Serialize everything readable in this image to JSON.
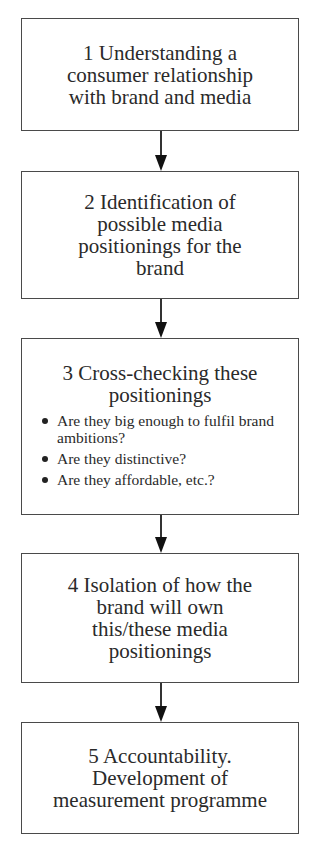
{
  "diagram": {
    "type": "flowchart",
    "steps": [
      {
        "number": "1",
        "title": "1  Understanding a consumer relationship with brand and media",
        "lines": [
          "1  Understanding a",
          "consumer relationship",
          "with brand and media"
        ]
      },
      {
        "number": "2",
        "title": "2  Identification of possible media positionings for the brand",
        "lines": [
          "2  Identification of",
          "possible media",
          "positionings for the",
          "brand"
        ]
      },
      {
        "number": "3",
        "title": "3  Cross-checking these positionings",
        "lines": [
          "3  Cross-checking these",
          "positionings"
        ],
        "bullets": [
          "Are they big enough to fulfil brand ambitions?",
          "Are they distinctive?",
          "Are they affordable, etc.?"
        ]
      },
      {
        "number": "4",
        "title": "4  Isolation of how the brand will own this/these media positionings",
        "lines": [
          "4  Isolation of how the",
          "brand will own",
          "this/these media",
          "positionings"
        ]
      },
      {
        "number": "5",
        "title": "5  Accountability. Development of measurement programme",
        "lines": [
          "5  Accountability.",
          "Development of",
          "measurement programme"
        ]
      }
    ],
    "connectors": [
      {
        "from": "1",
        "to": "2"
      },
      {
        "from": "2",
        "to": "3"
      },
      {
        "from": "3",
        "to": "4"
      },
      {
        "from": "4",
        "to": "5"
      }
    ]
  }
}
